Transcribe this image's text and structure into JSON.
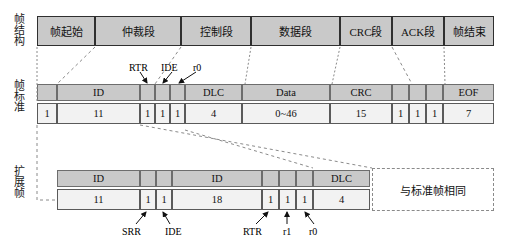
{
  "figure": {
    "row_labels": {
      "structure": "帧结构",
      "standard": "帧标准",
      "extended": "扩展帧"
    }
  },
  "colors": {
    "gray_fill": "#c9c9c9",
    "light_fill": "#f2f2f2",
    "stroke": "#2f2f2f",
    "dashed": "#8a8a8a"
  },
  "frame_structure": {
    "segments": [
      {
        "label": "帧起始",
        "x": 37,
        "w": 58
      },
      {
        "label": "仲裁段",
        "x": 95,
        "w": 86
      },
      {
        "label": "控制段",
        "x": 181,
        "w": 70
      },
      {
        "label": "数据段",
        "x": 251,
        "w": 89
      },
      {
        "label": "CRC段",
        "x": 340,
        "w": 52
      },
      {
        "label": "ACK段",
        "x": 392,
        "w": 52
      },
      {
        "label": "帧结束",
        "x": 444,
        "w": 50
      }
    ]
  },
  "standard_frame": {
    "fields": [
      {
        "label": "",
        "bits": "1",
        "x": 37,
        "w": 20
      },
      {
        "label": "ID",
        "bits": "11",
        "x": 57,
        "w": 83
      },
      {
        "label": "",
        "bits": "1",
        "x": 140,
        "w": 15
      },
      {
        "label": "",
        "bits": "1",
        "x": 155,
        "w": 15
      },
      {
        "label": "",
        "bits": "1",
        "x": 170,
        "w": 15
      },
      {
        "label": "DLC",
        "bits": "4",
        "x": 185,
        "w": 57
      },
      {
        "label": "Data",
        "bits": "0~46",
        "x": 242,
        "w": 88
      },
      {
        "label": "CRC",
        "bits": "15",
        "x": 330,
        "w": 62
      },
      {
        "label": "",
        "bits": "1",
        "x": 392,
        "w": 17
      },
      {
        "label": "",
        "bits": "1",
        "x": 409,
        "w": 17
      },
      {
        "label": "",
        "bits": "1",
        "x": 426,
        "w": 17
      },
      {
        "label": "EOF",
        "bits": "7",
        "x": 443,
        "w": 51
      }
    ],
    "annotations": [
      {
        "text": "RTR",
        "x": 129,
        "y": 62
      },
      {
        "text": "IDE",
        "x": 160,
        "y": 62
      },
      {
        "text": "r0",
        "x": 192,
        "y": 62
      }
    ]
  },
  "extended_frame": {
    "fields": [
      {
        "label": "ID",
        "bits": "11",
        "x": 57,
        "w": 83
      },
      {
        "label": "",
        "bits": "1",
        "x": 140,
        "w": 16
      },
      {
        "label": "",
        "bits": "1",
        "x": 156,
        "w": 16
      },
      {
        "label": "ID",
        "bits": "18",
        "x": 172,
        "w": 90
      },
      {
        "label": "",
        "bits": "1",
        "x": 262,
        "w": 17
      },
      {
        "label": "",
        "bits": "1",
        "x": 279,
        "w": 17
      },
      {
        "label": "",
        "bits": "1",
        "x": 296,
        "w": 17
      },
      {
        "label": "DLC",
        "bits": "4",
        "x": 313,
        "w": 57
      }
    ],
    "annotations": [
      {
        "text": "SRR",
        "x": 125,
        "y": 228
      },
      {
        "text": "IDE",
        "x": 163,
        "y": 228
      },
      {
        "text": "RTR",
        "x": 241,
        "y": 228
      },
      {
        "text": "r1",
        "x": 281,
        "y": 228
      },
      {
        "text": "r0",
        "x": 308,
        "y": 228
      }
    ],
    "same_as_standard_note": "与标准帧相同"
  }
}
